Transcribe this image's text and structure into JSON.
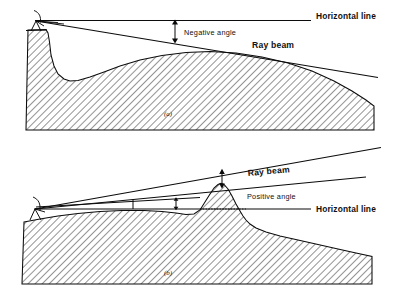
{
  "figure": {
    "panels": [
      {
        "id": "a",
        "caption": "(a)",
        "angle_sign": "negative",
        "labels": {
          "horizontal_line": "Horizontal line",
          "angle": "Negative angle",
          "ray_beam": "Ray beam"
        }
      },
      {
        "id": "b",
        "caption": "(b)",
        "angle_sign": "positive",
        "labels": {
          "horizontal_line": "Horizontal line",
          "angle": "Positive angle",
          "ray_beam": "Ray beam"
        }
      }
    ],
    "icons": {
      "antenna": "antenna-icon",
      "angle_arrow": "double-headed-arrow-icon",
      "terrain": "terrain-hatch-icon"
    },
    "colors": {
      "ink": "#0b0b0b",
      "background": "#ffffff",
      "hatch": "#3a3a3a"
    }
  }
}
